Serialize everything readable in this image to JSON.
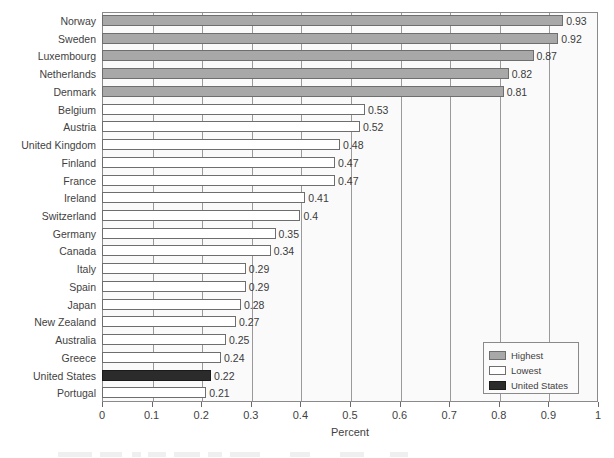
{
  "chart_data": {
    "type": "bar",
    "orientation": "horizontal",
    "title": "",
    "xlabel": "Percent",
    "ylabel": "",
    "xlim": [
      0,
      1
    ],
    "xticks": [
      "0",
      "0.1",
      "0.2",
      "0.3",
      "0.4",
      "0.5",
      "0.6",
      "0.7",
      "0.8",
      "0.9",
      "1"
    ],
    "xtick_values": [
      0,
      0.1,
      0.2,
      0.3,
      0.4,
      0.5,
      0.6,
      0.7,
      0.8,
      0.9,
      1
    ],
    "grid": "vertical",
    "legend_position": "bottom-right",
    "categories": [
      "Norway",
      "Sweden",
      "Luxembourg",
      "Netherlands",
      "Denmark",
      "Belgium",
      "Austria",
      "United Kingdom",
      "Finland",
      "France",
      "Ireland",
      "Switzerland",
      "Germany",
      "Canada",
      "Italy",
      "Spain",
      "Japan",
      "New Zealand",
      "Australia",
      "Greece",
      "United States",
      "Portugal"
    ],
    "values": [
      0.93,
      0.92,
      0.87,
      0.82,
      0.81,
      0.53,
      0.52,
      0.48,
      0.47,
      0.47,
      0.41,
      0.4,
      0.35,
      0.34,
      0.29,
      0.29,
      0.28,
      0.27,
      0.25,
      0.24,
      0.22,
      0.21
    ],
    "value_labels": [
      "0.93",
      "0.92",
      "0.87",
      "0.82",
      "0.81",
      "0.53",
      "0.52",
      "0.48",
      "0.47",
      "0.47",
      "0.41",
      "0.4",
      "0.35",
      "0.34",
      "0.29",
      "0.29",
      "0.28",
      "0.27",
      "0.25",
      "0.24",
      "0.22",
      "0.21"
    ],
    "bar_styles": [
      "highest",
      "highest",
      "highest",
      "highest",
      "highest",
      "lowest",
      "lowest",
      "lowest",
      "lowest",
      "lowest",
      "lowest",
      "lowest",
      "lowest",
      "lowest",
      "lowest",
      "lowest",
      "lowest",
      "lowest",
      "lowest",
      "lowest",
      "us",
      "lowest"
    ],
    "legend": [
      {
        "label": "Highest",
        "style": "highest",
        "color": "#a8a8a8"
      },
      {
        "label": "Lowest",
        "style": "lowest",
        "color": "#ffffff"
      },
      {
        "label": "United States",
        "style": "us",
        "color": "#2b2b2b"
      }
    ]
  },
  "colors": {
    "highest": "#a8a8a8",
    "lowest": "#ffffff",
    "united_states": "#2b2b2b",
    "bar_border": "#6e6e6e",
    "plot_background": "#fafafa",
    "gridline": "#9a9a9a",
    "axis": "#8a8a8a",
    "text": "#3f3f3f"
  }
}
